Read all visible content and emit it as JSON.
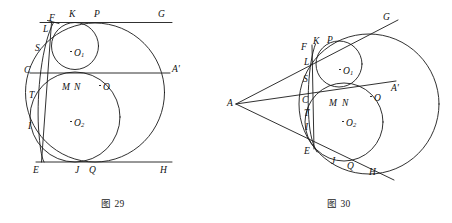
{
  "document": {
    "type": "geometry-figure-pair",
    "description": "Two plane-geometry diagrams of tangent circles and tangent lines"
  },
  "figures": [
    {
      "id": "fig29",
      "caption": "图 29",
      "caption_number": "29",
      "caption_prefix": "图",
      "description": "Large circle O with inscribed small circle O1 above and circle O2 below, two horizontal parallel lines FG and EH tangent to the large circle, a horizontal secant CA', and a near-vertical arc/line through F, L, S, T, I, E.",
      "lines": [
        {
          "name": "line-FG",
          "label_start": "F",
          "label_end": "G",
          "orientation": "horizontal-top"
        },
        {
          "name": "line-CA-prime",
          "label_start": "C",
          "label_end": "A'",
          "orientation": "horizontal-middle"
        },
        {
          "name": "line-EH",
          "label_start": "E",
          "label_end": "H",
          "orientation": "horizontal-bottom"
        }
      ],
      "circles": [
        {
          "name": "circle-O",
          "center_label": "O",
          "role": "large-circle"
        },
        {
          "name": "circle-O1",
          "center_label": "O",
          "center_sub": "1",
          "role": "small-upper-circle"
        },
        {
          "name": "circle-O2",
          "center_label": "O",
          "center_sub": "2",
          "role": "medium-lower-circle"
        }
      ],
      "labels": [
        {
          "name": "point-F",
          "text": "F",
          "x": 49,
          "y": 14
        },
        {
          "name": "point-K",
          "text": "K",
          "x": 69,
          "y": 10
        },
        {
          "name": "point-P",
          "text": "P",
          "x": 94,
          "y": 10
        },
        {
          "name": "point-G",
          "text": "G",
          "x": 158,
          "y": 10
        },
        {
          "name": "point-L",
          "text": "L",
          "x": 43,
          "y": 25
        },
        {
          "name": "point-S",
          "text": "S",
          "x": 35,
          "y": 44
        },
        {
          "name": "point-C",
          "text": "C",
          "x": 24,
          "y": 66
        },
        {
          "name": "point-A-prime",
          "text": "A'",
          "x": 172,
          "y": 66
        },
        {
          "name": "point-M",
          "text": "M",
          "x": 63,
          "y": 83
        },
        {
          "name": "point-N",
          "text": "N",
          "x": 74,
          "y": 83
        },
        {
          "name": "point-O",
          "text": "O",
          "x": 103,
          "y": 88
        },
        {
          "name": "point-T",
          "text": "T",
          "x": 29,
          "y": 91
        },
        {
          "name": "point-I",
          "text": "I",
          "x": 28,
          "y": 122
        },
        {
          "name": "point-E",
          "text": "E",
          "x": 33,
          "y": 167
        },
        {
          "name": "point-J",
          "text": "J",
          "x": 75,
          "y": 167
        },
        {
          "name": "point-Q",
          "text": "Q",
          "x": 89,
          "y": 167
        },
        {
          "name": "point-H",
          "text": "H",
          "x": 160,
          "y": 167
        }
      ],
      "center_labels": [
        {
          "name": "center-O1-label",
          "base": "O",
          "sub": "1",
          "x": 74,
          "y": 54
        },
        {
          "name": "center-O-label",
          "base": "O",
          "sub": "",
          "x": 103,
          "y": 88
        },
        {
          "name": "center-O2-label",
          "base": "O",
          "sub": "2",
          "x": 74,
          "y": 124
        }
      ]
    },
    {
      "id": "fig30",
      "caption": "图 30",
      "caption_number": "30",
      "caption_prefix": "图",
      "description": "Same configuration seen from external point A: two tangent rays AG and AH from vertex A touching the large circle, a secant ray through C and A', and a near-vertical arc through F, L, S, C, T, I, E.",
      "lines": [
        {
          "name": "ray-AG",
          "label_start": "A",
          "label_end": "G",
          "orientation": "upper-tangent"
        },
        {
          "name": "ray-AA-prime",
          "label_start": "A",
          "label_end": "A'",
          "orientation": "middle-secant"
        },
        {
          "name": "ray-AH",
          "label_start": "A",
          "label_end": "H",
          "orientation": "lower-tangent"
        }
      ],
      "circles": [
        {
          "name": "circle-O",
          "center_label": "O",
          "role": "large-circle"
        },
        {
          "name": "circle-O1",
          "center_label": "O",
          "center_sub": "1",
          "role": "small-upper-circle"
        },
        {
          "name": "circle-O2",
          "center_label": "O",
          "center_sub": "2",
          "role": "medium-lower-circle"
        }
      ],
      "labels": [
        {
          "name": "point-A",
          "text": "A",
          "x": 2,
          "y": 100
        },
        {
          "name": "point-G",
          "text": "G",
          "x": 157,
          "y": 14
        },
        {
          "name": "point-F",
          "text": "F",
          "x": 76,
          "y": 44
        },
        {
          "name": "point-K",
          "text": "K",
          "x": 88,
          "y": 38
        },
        {
          "name": "point-P",
          "text": "P",
          "x": 101,
          "y": 37
        },
        {
          "name": "point-L",
          "text": "L",
          "x": 79,
          "y": 59
        },
        {
          "name": "point-S",
          "text": "S",
          "x": 78,
          "y": 76
        },
        {
          "name": "point-C",
          "text": "C",
          "x": 77,
          "y": 97
        },
        {
          "name": "point-A-prime",
          "text": "A'",
          "x": 167,
          "y": 85
        },
        {
          "name": "point-M",
          "text": "M",
          "x": 104,
          "y": 100
        },
        {
          "name": "point-N",
          "text": "N",
          "x": 116,
          "y": 100
        },
        {
          "name": "point-O",
          "text": "O",
          "x": 148,
          "y": 99
        },
        {
          "name": "point-T",
          "text": "T",
          "x": 79,
          "y": 110
        },
        {
          "name": "point-I",
          "text": "I",
          "x": 79,
          "y": 124
        },
        {
          "name": "point-E",
          "text": "E",
          "x": 79,
          "y": 148
        },
        {
          "name": "point-J",
          "text": "J",
          "x": 105,
          "y": 158
        },
        {
          "name": "point-Q",
          "text": "Q",
          "x": 121,
          "y": 163
        },
        {
          "name": "point-H",
          "text": "H",
          "x": 143,
          "y": 169
        }
      ],
      "center_labels": [
        {
          "name": "center-O1-label",
          "base": "O",
          "sub": "1",
          "x": 117,
          "y": 68
        },
        {
          "name": "center-O-label",
          "base": "O",
          "sub": "",
          "x": 148,
          "y": 99
        },
        {
          "name": "center-O2-label",
          "base": "O",
          "sub": "2",
          "x": 120,
          "y": 124
        }
      ]
    }
  ],
  "style": {
    "stroke_color": "#1a1a1a",
    "background_color": "#ffffff",
    "label_color": "#111111"
  }
}
